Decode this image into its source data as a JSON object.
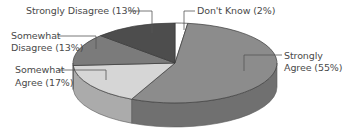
{
  "chart_data": {
    "type": "pie",
    "style": "3d",
    "title": "",
    "categories": [
      "Don't Know",
      "Strongly Agree",
      "Somewhat Agree",
      "Somewhat Disagree",
      "Strongly Disagree"
    ],
    "values": [
      2,
      55,
      17,
      13,
      13
    ],
    "unit": "%",
    "legend": "none (leader-line labels)",
    "colors": {
      "Don't Know": "#ffffff",
      "Strongly Agree": "#8c8c8c",
      "Somewhat Agree": "#d6d6d6",
      "Somewhat Disagree": "#7b7b7b",
      "Strongly Disagree": "#4d4d4d"
    }
  },
  "labels": {
    "strongly_disagree": "Strongly Disagree (13%)",
    "dont_know": "Don't Know (2%)",
    "somewhat_disagree_l1": "Somewhat",
    "somewhat_disagree_l2": "Disagree (13%)",
    "somewhat_agree_l1": "Somewhat",
    "somewhat_agree_l2": "Agree (17%)",
    "strongly_agree_l1": "Strongly",
    "strongly_agree_l2": "Agree (55%)"
  }
}
